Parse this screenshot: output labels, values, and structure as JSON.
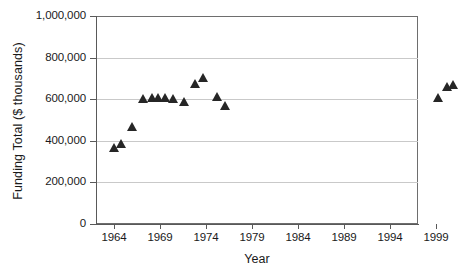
{
  "chart_data": {
    "type": "scatter",
    "title": "",
    "xlabel": "Year",
    "ylabel": "Funding Total ($ thousands)",
    "xlim": [
      1962.0,
      1997.0
    ],
    "ylim": [
      0,
      1000000
    ],
    "xticks": [
      1964,
      1969,
      1974,
      1979,
      1984,
      1989,
      1994,
      1999
    ],
    "xtick_labels": [
      "1964",
      "1969",
      "1974",
      "1979",
      "1984",
      "1989",
      "1994",
      "1999"
    ],
    "yticks": [
      0,
      200000,
      400000,
      600000,
      800000,
      1000000
    ],
    "ytick_labels": [
      "0",
      "200,000",
      "400,000",
      "600,000",
      "800,000",
      "1,000,000"
    ],
    "grid": "horizontal",
    "legend": null,
    "marker": "triangle",
    "marker_color": "#262626",
    "series": [
      {
        "name": "Funding Total",
        "x": [
          1964.0,
          1964.8,
          1966.0,
          1967.2,
          1968.1,
          1968.8,
          1969.5,
          1970.4,
          1971.6,
          1972.8,
          1973.7,
          1975.2,
          1976.1,
          1999.2,
          2000.2,
          2000.9
        ],
        "values": [
          365000,
          385000,
          465000,
          600000,
          605000,
          608000,
          605000,
          600000,
          585000,
          675000,
          700000,
          612000,
          565000,
          605000,
          660000,
          670000
        ]
      }
    ]
  },
  "axes": {
    "y_title": "Funding Total ($ thousands)",
    "x_title": "Year"
  }
}
